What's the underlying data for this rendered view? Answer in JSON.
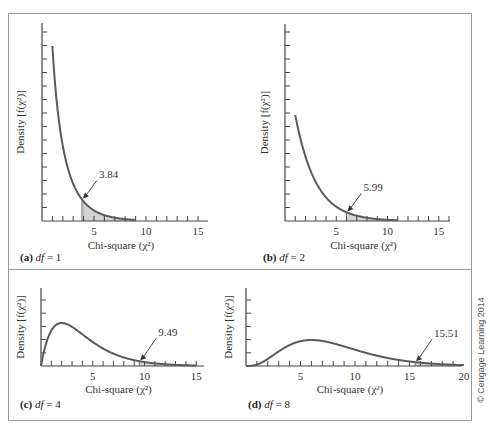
{
  "figure": {
    "copyright": "© Cengage Learning 2014"
  },
  "chart_data": [
    {
      "type": "line",
      "panel": "a",
      "label_bold": "(a)",
      "label_df": "df",
      "label_value": "= 1",
      "df": 1,
      "critical_value": 3.84,
      "critical_label": "3.84",
      "xlabel": "Chi-square (χ²)",
      "ylabel": "Density [f(χ²)]",
      "xlim": [
        0,
        16
      ],
      "xticks": [
        5,
        10,
        15
      ],
      "x_curve_range": [
        1,
        9
      ],
      "shaded_region": [
        3.84,
        9
      ],
      "y_ticks_count": 15
    },
    {
      "type": "line",
      "panel": "b",
      "label_bold": "(b)",
      "label_df": "df",
      "label_value": "= 2",
      "df": 2,
      "critical_value": 5.99,
      "critical_label": "5.99",
      "xlabel": "Chi-square (χ²)",
      "ylabel": "Density [f(χ²)]",
      "xlim": [
        0,
        16
      ],
      "xticks": [
        5,
        10,
        15
      ],
      "x_curve_range": [
        1,
        11
      ],
      "shaded_region": [
        5.99,
        11
      ],
      "y_ticks_count": 15
    },
    {
      "type": "line",
      "panel": "c",
      "label_bold": "(c)",
      "label_df": "df",
      "label_value": "= 4",
      "df": 4,
      "critical_value": 9.49,
      "critical_label": "9.49",
      "xlabel": "Chi-square (χ²)",
      "ylabel": "Density [f(χ²)]",
      "xlim": [
        0,
        16
      ],
      "xticks": [
        5,
        10,
        15
      ],
      "x_curve_range": [
        0,
        15
      ],
      "shaded_region": [
        9.49,
        15
      ],
      "y_ticks_count": 5
    },
    {
      "type": "line",
      "panel": "d",
      "label_bold": "(d)",
      "label_df": "df",
      "label_value": "= 8",
      "df": 8,
      "critical_value": 15.51,
      "critical_label": "15.51",
      "xlabel": "Chi-square (χ²)",
      "ylabel": "Density [f(χ²)]",
      "xlim": [
        0,
        21
      ],
      "xticks": [
        5,
        10,
        15,
        20
      ],
      "x_curve_range": [
        0,
        20
      ],
      "shaded_region": [
        15.51,
        20
      ],
      "y_ticks_count": 5
    }
  ],
  "colors": {
    "curve": "#5a5a5a",
    "shade": "#d4d4d4",
    "axis": "#444444",
    "frame": "#9a9a9a"
  }
}
